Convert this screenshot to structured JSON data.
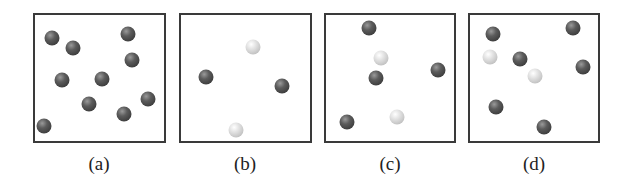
{
  "panels": [
    {
      "label": "(a)",
      "box": {
        "left": 33,
        "top": 13,
        "width": 133,
        "height": 130
      },
      "spheres": [
        {
          "x": 52,
          "y": 38,
          "type": "dark"
        },
        {
          "x": 73,
          "y": 48,
          "type": "dark"
        },
        {
          "x": 128,
          "y": 34,
          "type": "dark"
        },
        {
          "x": 132,
          "y": 60,
          "type": "dark"
        },
        {
          "x": 62,
          "y": 80,
          "type": "dark"
        },
        {
          "x": 102,
          "y": 79,
          "type": "dark"
        },
        {
          "x": 89,
          "y": 104,
          "type": "dark"
        },
        {
          "x": 124,
          "y": 114,
          "type": "dark"
        },
        {
          "x": 148,
          "y": 99,
          "type": "dark"
        },
        {
          "x": 44,
          "y": 126,
          "type": "dark"
        }
      ]
    },
    {
      "label": "(b)",
      "box": {
        "left": 179,
        "top": 13,
        "width": 133,
        "height": 130
      },
      "spheres": [
        {
          "x": 253,
          "y": 47,
          "type": "light"
        },
        {
          "x": 206,
          "y": 77,
          "type": "dark"
        },
        {
          "x": 282,
          "y": 86,
          "type": "dark"
        },
        {
          "x": 236,
          "y": 130,
          "type": "light"
        }
      ]
    },
    {
      "label": "(c)",
      "box": {
        "left": 324,
        "top": 13,
        "width": 132,
        "height": 130
      },
      "spheres": [
        {
          "x": 369,
          "y": 28,
          "type": "dark"
        },
        {
          "x": 381,
          "y": 58,
          "type": "light"
        },
        {
          "x": 376,
          "y": 78,
          "type": "dark"
        },
        {
          "x": 438,
          "y": 70,
          "type": "dark"
        },
        {
          "x": 347,
          "y": 122,
          "type": "dark"
        },
        {
          "x": 397,
          "y": 117,
          "type": "light"
        }
      ]
    },
    {
      "label": "(d)",
      "box": {
        "left": 468,
        "top": 13,
        "width": 132,
        "height": 130
      },
      "spheres": [
        {
          "x": 493,
          "y": 34,
          "type": "dark"
        },
        {
          "x": 573,
          "y": 28,
          "type": "dark"
        },
        {
          "x": 490,
          "y": 57,
          "type": "light"
        },
        {
          "x": 520,
          "y": 59,
          "type": "dark"
        },
        {
          "x": 535,
          "y": 76,
          "type": "light"
        },
        {
          "x": 583,
          "y": 67,
          "type": "dark"
        },
        {
          "x": 496,
          "y": 107,
          "type": "dark"
        },
        {
          "x": 544,
          "y": 127,
          "type": "dark"
        }
      ]
    }
  ],
  "colors": {
    "dark_sphere": "#4a4a4a",
    "light_sphere": "#c8c8c8",
    "border": "#3a3a3a"
  }
}
